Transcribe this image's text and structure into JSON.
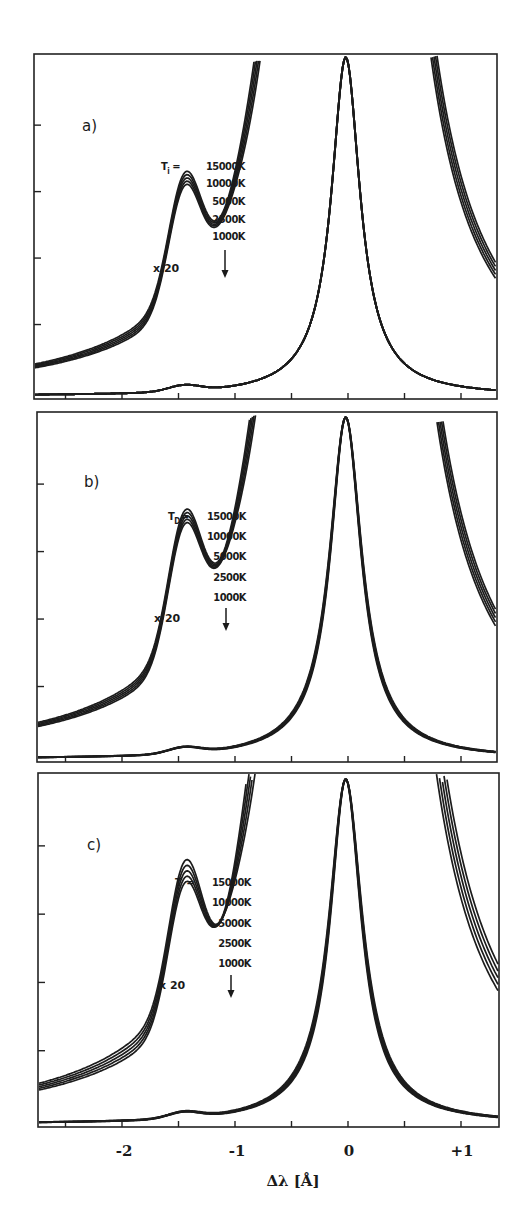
{
  "figure": {
    "x_axis": {
      "title": "Δλ [Å]",
      "tick_labels": [
        {
          "value": -2,
          "label": "-2"
        },
        {
          "value": -1,
          "label": "-1"
        },
        {
          "value": 0,
          "label": "0"
        },
        {
          "value": 1,
          "label": "+1"
        }
      ]
    },
    "panels": [
      {
        "id": "a",
        "label": "a)",
        "param_symbol": "T",
        "param_subscript": "i",
        "param_prefix": "T",
        "equals": "=",
        "temperatures": [
          "15000K",
          "10000K",
          "5000K",
          "2500K",
          "1000K"
        ],
        "scale_label": "x 20",
        "arrow": "down-arrow"
      },
      {
        "id": "b",
        "label": "b)",
        "param_prefix": "T",
        "param_subscript": "D",
        "equals": "=",
        "temperatures": [
          "15000K",
          "10000K",
          "5000K",
          "2500K",
          "1000K"
        ],
        "scale_label": "x 20",
        "arrow": "down-arrow"
      },
      {
        "id": "c",
        "label": "c)",
        "param_prefix": "T",
        "param_subscript": "",
        "equals": "=",
        "temperatures": [
          "15000K",
          "10000K",
          "5000K",
          "2500K",
          "1000K"
        ],
        "scale_label": "x 20",
        "arrow": "down-arrow"
      }
    ]
  },
  "chart_data": [
    {
      "type": "line",
      "title": "a)",
      "xlabel": "Δλ [Å]",
      "ylabel": "",
      "xlim": [
        -2.72,
        1.35
      ],
      "x_ticks": [
        -2.5,
        -2,
        -1.5,
        -1,
        -0.5,
        0,
        0.5,
        1
      ],
      "y_ticks_count": 4,
      "legend_title": "T_i",
      "legend": [
        "15000K",
        "10000K",
        "5000K",
        "2500K",
        "1000K"
      ],
      "annotations": [
        "a)",
        "T_i = 15000K, 10000K, 5000K, 2500K, 1000K",
        "x 20",
        "arrow at Δλ ≈ -1.1"
      ],
      "series_description": "Line profile (unscaled) peaking at Δλ≈-0.03 with normalized intensity 1.0; the same profile magnified x20 clipped at top; satellite bump near Δλ≈-1.45 and dip near Δλ≈-1.1 that deepens as temperature decreases",
      "series": [
        {
          "name": "x1 profile",
          "x": [
            -2.7,
            -2.0,
            -1.45,
            -1.1,
            -0.5,
            -0.2,
            -0.03,
            0.15,
            0.5,
            1.0,
            1.34
          ],
          "y": [
            0.005,
            0.012,
            0.025,
            0.02,
            0.09,
            0.45,
            1.0,
            0.55,
            0.1,
            0.03,
            0.02
          ]
        },
        {
          "name": "x20 15000K",
          "x": [
            -2.7,
            -2.0,
            -1.45,
            -1.1,
            -0.8,
            -0.5
          ],
          "y": [
            0.09,
            0.2,
            0.33,
            0.28,
            0.42,
            1.0
          ]
        },
        {
          "name": "x20 10000K",
          "x": [
            -2.7,
            -2.0,
            -1.45,
            -1.1,
            -0.8,
            -0.5
          ],
          "y": [
            0.09,
            0.2,
            0.33,
            0.265,
            0.41,
            1.0
          ]
        },
        {
          "name": "x20 5000K",
          "x": [
            -2.7,
            -2.0,
            -1.45,
            -1.1,
            -0.8,
            -0.5
          ],
          "y": [
            0.09,
            0.2,
            0.33,
            0.25,
            0.4,
            1.0
          ]
        },
        {
          "name": "x20 2500K",
          "x": [
            -2.7,
            -2.0,
            -1.45,
            -1.1,
            -0.8,
            -0.5
          ],
          "y": [
            0.09,
            0.2,
            0.33,
            0.235,
            0.39,
            1.0
          ]
        },
        {
          "name": "x20 1000K",
          "x": [
            -2.7,
            -2.0,
            -1.45,
            -1.1,
            -0.8,
            -0.5
          ],
          "y": [
            0.09,
            0.2,
            0.33,
            0.22,
            0.38,
            1.0
          ]
        }
      ],
      "render": {
        "frame": [
          34,
          54,
          497,
          399
        ],
        "x0_px": 348,
        "px_per_A": 113,
        "peak_y": 57,
        "spread": [
          0,
          2.4,
          4.8,
          7.2,
          9.6
        ],
        "core_spread": [
          0,
          0,
          0,
          0,
          0
        ],
        "bump_y": 300,
        "dip_top": 323,
        "dip_step": 4.2,
        "core_w": 0.15,
        "wing_w": 0.42
      }
    },
    {
      "type": "line",
      "title": "b)",
      "xlabel": "Δλ [Å]",
      "ylabel": "",
      "xlim": [
        -2.72,
        1.35
      ],
      "x_ticks": [
        -2.5,
        -2,
        -1.5,
        -1,
        -0.5,
        0,
        0.5,
        1
      ],
      "y_ticks_count": 4,
      "legend_title": "T_D",
      "legend": [
        "15000K",
        "10000K",
        "5000K",
        "2500K",
        "1000K"
      ],
      "annotations": [
        "b)",
        "T_D = 15000K, 10000K, 5000K, 2500K, 1000K",
        "x 20",
        "arrow at Δλ ≈ -1.1"
      ],
      "series_description": "Same line profiles with Doppler temperature varied; curves broaden slightly overall with temperature (bands in core and wings)",
      "series": [
        {
          "name": "x1 profile",
          "x": [
            -2.7,
            -2.0,
            -1.45,
            -1.1,
            -0.5,
            -0.2,
            0.0,
            0.2,
            0.5,
            1.0,
            1.34
          ],
          "y": [
            0.005,
            0.012,
            0.025,
            0.02,
            0.1,
            0.5,
            1.0,
            0.5,
            0.1,
            0.03,
            0.02
          ]
        },
        {
          "name": "x20 15000K",
          "x": [
            -2.7,
            -2.0,
            -1.45,
            -1.1,
            -0.8,
            -0.5
          ],
          "y": [
            0.08,
            0.19,
            0.34,
            0.27,
            0.42,
            1.0
          ]
        },
        {
          "name": "x20 10000K",
          "x": [
            -2.7,
            -2.0,
            -1.45,
            -1.1,
            -0.8,
            -0.5
          ],
          "y": [
            0.08,
            0.19,
            0.335,
            0.255,
            0.41,
            1.0
          ]
        },
        {
          "name": "x20 5000K",
          "x": [
            -2.7,
            -2.0,
            -1.45,
            -1.1,
            -0.8,
            -0.5
          ],
          "y": [
            0.08,
            0.19,
            0.33,
            0.24,
            0.4,
            1.0
          ]
        },
        {
          "name": "x20 2500K",
          "x": [
            -2.7,
            -2.0,
            -1.45,
            -1.1,
            -0.8,
            -0.5
          ],
          "y": [
            0.08,
            0.19,
            0.325,
            0.225,
            0.39,
            1.0
          ]
        },
        {
          "name": "x20 1000K",
          "x": [
            -2.7,
            -2.0,
            -1.45,
            -1.1,
            -0.8,
            -0.5
          ],
          "y": [
            0.08,
            0.19,
            0.32,
            0.21,
            0.38,
            1.0
          ]
        }
      ],
      "render": {
        "frame": [
          37,
          412,
          497,
          762
        ],
        "x0_px": 348,
        "px_per_A": 113,
        "peak_y": 417,
        "spread": [
          0,
          2.2,
          4.4,
          6.6,
          8.8
        ],
        "core_spread": [
          0,
          1.6,
          3.2,
          4.8,
          6.4
        ],
        "bump_y": 652,
        "dip_top": 685,
        "dip_step": 4.8,
        "core_w": 0.16,
        "wing_w": 0.44
      }
    },
    {
      "type": "line",
      "title": "c)",
      "xlabel": "Δλ [Å]",
      "ylabel": "",
      "xlim": [
        -2.72,
        1.35
      ],
      "x_ticks": [
        -2.5,
        -2,
        -1.5,
        -1,
        -0.5,
        0,
        0.5,
        1
      ],
      "y_ticks_count": 4,
      "legend_title": "T",
      "legend": [
        "15000K",
        "10000K",
        "5000K",
        "2500K",
        "1000K"
      ],
      "annotations": [
        "c)",
        "T = 15000K, 10000K, 5000K, 2500K, 1000K",
        "x 20",
        "arrow at Δλ ≈ -1.1"
      ],
      "series_description": "Both temperatures varied together; the x20 curves separate strongly in the dip region (15000K highest) and in the wings",
      "series": [
        {
          "name": "x1 profile",
          "x": [
            -2.7,
            -2.0,
            -1.45,
            -1.1,
            -0.5,
            -0.2,
            0.0,
            0.2,
            0.5,
            1.0,
            1.34
          ],
          "y": [
            0.005,
            0.012,
            0.025,
            0.02,
            0.1,
            0.5,
            1.0,
            0.5,
            0.1,
            0.03,
            0.02
          ]
        },
        {
          "name": "x20 15000K",
          "x": [
            -2.7,
            -2.0,
            -1.45,
            -1.1,
            -0.8,
            -0.5
          ],
          "y": [
            0.08,
            0.2,
            0.35,
            0.31,
            0.47,
            1.0
          ]
        },
        {
          "name": "x20 10000K",
          "x": [
            -2.7,
            -2.0,
            -1.45,
            -1.1,
            -0.8,
            -0.5
          ],
          "y": [
            0.08,
            0.2,
            0.34,
            0.27,
            0.43,
            1.0
          ]
        },
        {
          "name": "x20 5000K",
          "x": [
            -2.7,
            -2.0,
            -1.45,
            -1.1,
            -0.8,
            -0.5
          ],
          "y": [
            0.08,
            0.2,
            0.335,
            0.25,
            0.41,
            1.0
          ]
        },
        {
          "name": "x20 2500K",
          "x": [
            -2.7,
            -2.0,
            -1.45,
            -1.1,
            -0.8,
            -0.5
          ],
          "y": [
            0.08,
            0.2,
            0.33,
            0.235,
            0.4,
            1.0
          ]
        },
        {
          "name": "x20 1000K",
          "x": [
            -2.7,
            -2.0,
            -1.45,
            -1.1,
            -0.8,
            -0.5
          ],
          "y": [
            0.08,
            0.2,
            0.325,
            0.22,
            0.39,
            1.0
          ]
        }
      ],
      "render": {
        "frame": [
          38,
          773,
          499,
          1127
        ],
        "x0_px": 348,
        "px_per_A": 113,
        "peak_y": 779,
        "spread": [
          0,
          3.5,
          7,
          10.5,
          14
        ],
        "core_spread": [
          0,
          2.2,
          4.4,
          6.6,
          8.8
        ],
        "bump_y": 1015,
        "dip_top": 1027,
        "dip_step": 9.5,
        "core_w": 0.16,
        "wing_w": 0.46
      }
    }
  ]
}
